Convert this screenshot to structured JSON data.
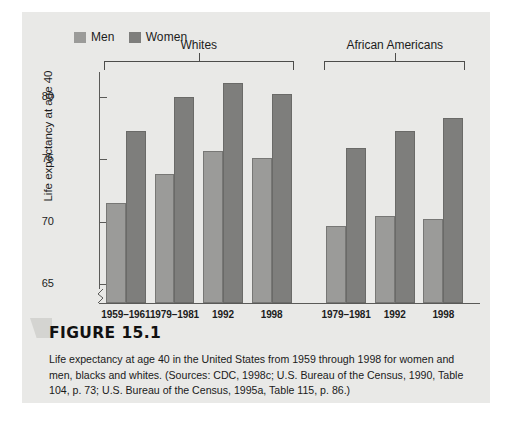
{
  "figure": {
    "number_label": "FIGURE 15.1",
    "caption": "Life expectancy at age 40 in the United States from 1959 through 1998 for women and men, blacks and whites. (Sources: CDC, 1998c; U.S. Bureau of the Census, 1990, Table 104, p. 73; U.S. Bureau of the Census, 1995a, Table 115, p. 86.)"
  },
  "colors": {
    "panel_background": "#e9e9e7",
    "men_bar": "#9b9b99",
    "women_bar": "#7e7e7c",
    "axis": "#5a5a58",
    "text": "#1c1c1c"
  },
  "chart_data": {
    "type": "bar",
    "title": "",
    "xlabel": "",
    "ylabel": "Life expectancy at age 40",
    "ylim": [
      63.5,
      82
    ],
    "yticks": [
      65,
      70,
      75,
      80
    ],
    "grid": false,
    "legend_position": "top-left",
    "axis_break": true,
    "groups": [
      {
        "name": "Whites",
        "categories": [
          "1959–1961",
          "1979–1981",
          "1992",
          "1998"
        ]
      },
      {
        "name": "African Americans",
        "categories": [
          "1979–1981",
          "1992",
          "1998"
        ]
      }
    ],
    "categories": [
      "1959–1961",
      "1979–1981",
      "1992",
      "1998",
      "1979–1981",
      "1992",
      "1998"
    ],
    "series": [
      {
        "name": "Men",
        "color": "#9b9b99",
        "values": [
          71.5,
          73.8,
          75.7,
          75.1,
          69.7,
          70.5,
          70.2
        ]
      },
      {
        "name": "Women",
        "color": "#7e7e7c",
        "values": [
          77.3,
          80.0,
          81.1,
          80.2,
          75.9,
          77.3,
          78.3
        ]
      }
    ]
  },
  "legend": {
    "entries": [
      {
        "label": "Men",
        "color": "#9b9b99"
      },
      {
        "label": "Women",
        "color": "#7e7e7c"
      }
    ]
  }
}
